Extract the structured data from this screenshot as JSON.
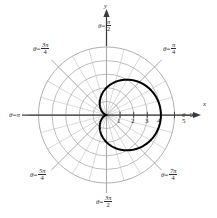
{
  "figure": {
    "type": "polar-plot",
    "background": "#ffffff",
    "curve_color": "#000000",
    "grid_color": "#9a9a9a",
    "grid_minor_color": "#b9b9b9",
    "axis_color": "#3a3a3a",
    "text_color": "#2b2b2b"
  },
  "axes": {
    "x_label": "x",
    "y_label": "y",
    "x_ticks": [
      "1",
      "2",
      "3",
      "4",
      "5"
    ],
    "pole_label": ""
  },
  "angle_labels": [
    {
      "name": "theta-0",
      "theta": "θ",
      "eq": "=",
      "value": "0",
      "kind": "plain",
      "degrees": 0
    },
    {
      "name": "theta-pi-4",
      "theta": "θ",
      "eq": "=",
      "num": "π",
      "den": "4",
      "kind": "frac",
      "degrees": 45
    },
    {
      "name": "theta-pi-2",
      "theta": "θ",
      "eq": "=",
      "num": "π",
      "den": "2",
      "kind": "frac",
      "degrees": 90
    },
    {
      "name": "theta-3pi-4",
      "theta": "θ",
      "eq": "=",
      "num": "3π",
      "den": "4",
      "kind": "frac",
      "degrees": 135
    },
    {
      "name": "theta-pi",
      "theta": "θ",
      "eq": "=",
      "value": "π",
      "kind": "plain",
      "degrees": 180
    },
    {
      "name": "theta-5pi-4",
      "theta": "θ",
      "eq": "=",
      "num": "5π",
      "den": "4",
      "kind": "frac",
      "degrees": 225
    },
    {
      "name": "theta-3pi-2",
      "theta": "θ",
      "eq": "=",
      "num": "3π",
      "den": "2",
      "kind": "frac",
      "degrees": 270
    },
    {
      "name": "theta-7pi-4",
      "theta": "θ",
      "eq": "=",
      "num": "7π",
      "den": "4",
      "kind": "frac",
      "degrees": 315
    }
  ],
  "chart_data": {
    "type": "line",
    "coordinate_system": "polar",
    "title": "",
    "xlabel": "x",
    "ylabel": "y",
    "grid": true,
    "legend": null,
    "radial_ticks": [
      1,
      2,
      3,
      4,
      5
    ],
    "radial_grid_circles": [
      1,
      2,
      3,
      4,
      5
    ],
    "angular_grid_step_degrees": 15,
    "angular_major_step_degrees": 45,
    "rlim": [
      0,
      5
    ],
    "tick_labels": [
      "1",
      "2",
      "3",
      "4",
      "5"
    ],
    "theta_tick_labels": [
      "0",
      "π/4",
      "π/2",
      "3π/4",
      "π",
      "5π/4",
      "3π/2",
      "7π/4"
    ],
    "series": [
      {
        "name": "cardioid",
        "equation": "r = 2(1 + cos θ)",
        "color": "#000000",
        "linewidth": 2,
        "r_at_theta": [
          {
            "theta_deg": 0,
            "r": 4.0
          },
          {
            "theta_deg": 15,
            "r": 3.93
          },
          {
            "theta_deg": 30,
            "r": 3.73
          },
          {
            "theta_deg": 45,
            "r": 3.41
          },
          {
            "theta_deg": 60,
            "r": 3.0
          },
          {
            "theta_deg": 75,
            "r": 2.52
          },
          {
            "theta_deg": 90,
            "r": 2.0
          },
          {
            "theta_deg": 105,
            "r": 1.48
          },
          {
            "theta_deg": 120,
            "r": 1.0
          },
          {
            "theta_deg": 135,
            "r": 0.59
          },
          {
            "theta_deg": 150,
            "r": 0.27
          },
          {
            "theta_deg": 165,
            "r": 0.07
          },
          {
            "theta_deg": 180,
            "r": 0.0
          },
          {
            "theta_deg": 195,
            "r": 0.07
          },
          {
            "theta_deg": 210,
            "r": 0.27
          },
          {
            "theta_deg": 225,
            "r": 0.59
          },
          {
            "theta_deg": 240,
            "r": 1.0
          },
          {
            "theta_deg": 255,
            "r": 1.48
          },
          {
            "theta_deg": 270,
            "r": 2.0
          },
          {
            "theta_deg": 285,
            "r": 2.52
          },
          {
            "theta_deg": 300,
            "r": 3.0
          },
          {
            "theta_deg": 315,
            "r": 3.41
          },
          {
            "theta_deg": 330,
            "r": 3.73
          },
          {
            "theta_deg": 345,
            "r": 3.93
          },
          {
            "theta_deg": 360,
            "r": 4.0
          }
        ]
      }
    ]
  }
}
